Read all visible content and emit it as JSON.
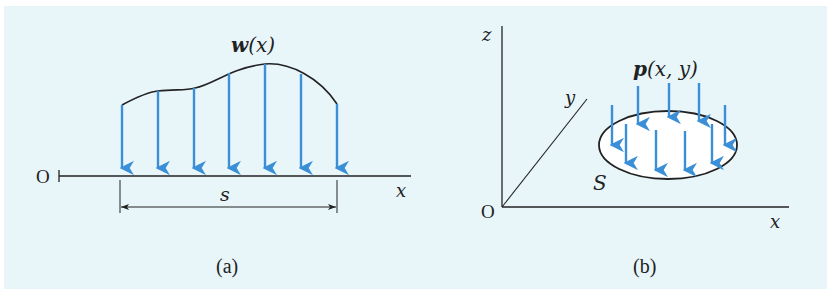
{
  "figure": {
    "background_color": "#e8f6fa",
    "arrow_color": "#3a8fd6",
    "line_color": "#222222",
    "panel_a": {
      "caption": "(a)",
      "origin_label": "O",
      "axis_label": "x",
      "load_label_bold": "w",
      "load_label_arg": "(x)",
      "span_label": "s",
      "arrow_count": 7
    },
    "panel_b": {
      "caption": "(b)",
      "origin_label": "O",
      "x_axis_label": "x",
      "y_axis_label": "y",
      "z_axis_label": "z",
      "load_label_bold": "p",
      "load_label_arg": "(x, y)",
      "surface_label": "S",
      "arrow_count": 11
    }
  }
}
